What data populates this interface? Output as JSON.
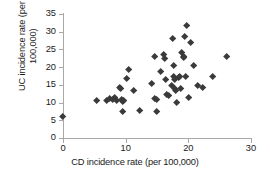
{
  "chart_data": {
    "type": "scatter",
    "title": "",
    "xlabel": "CD incidence rate (per 100,000)",
    "ylabel_line1": "UC incidence rate (per",
    "ylabel_line2": "100,000)",
    "ylabel": "UC incidence rate (per 100,000)",
    "xlim": [
      0,
      30
    ],
    "ylim": [
      0,
      35
    ],
    "xticks": [
      0,
      10,
      20,
      30
    ],
    "yticks": [
      0,
      5,
      10,
      15,
      20,
      25,
      30,
      35
    ],
    "xtick_labels": [
      "0",
      "10",
      "20",
      "30"
    ],
    "ytick_labels": [
      "0",
      "5",
      "10",
      "15",
      "20",
      "25",
      "30",
      "35"
    ],
    "grid": false,
    "legend": null,
    "marker": "diamond",
    "marker_color": "#3a3a3a",
    "axis_color": "#a8a8a8",
    "points": [
      [
        0.0,
        6.1
      ],
      [
        5.3,
        10.6
      ],
      [
        7.0,
        10.6
      ],
      [
        7.5,
        11.0
      ],
      [
        8.0,
        10.8
      ],
      [
        8.3,
        11.5
      ],
      [
        8.6,
        10.4
      ],
      [
        9.0,
        14.3
      ],
      [
        9.2,
        13.8
      ],
      [
        9.3,
        10.9
      ],
      [
        9.5,
        10.3
      ],
      [
        9.7,
        10.5
      ],
      [
        9.6,
        7.4
      ],
      [
        10.2,
        16.7
      ],
      [
        10.5,
        19.2
      ],
      [
        11.3,
        13.4
      ],
      [
        12.3,
        7.7
      ],
      [
        14.2,
        15.4
      ],
      [
        14.6,
        23.0
      ],
      [
        14.7,
        11.0
      ],
      [
        14.9,
        10.7
      ],
      [
        15.0,
        7.5
      ],
      [
        15.6,
        18.8
      ],
      [
        16.0,
        23.4
      ],
      [
        16.3,
        22.3
      ],
      [
        16.4,
        16.6
      ],
      [
        16.5,
        12.3
      ],
      [
        16.8,
        11.9
      ],
      [
        17.3,
        14.9
      ],
      [
        17.5,
        28.0
      ],
      [
        17.6,
        20.3
      ],
      [
        17.7,
        17.2
      ],
      [
        17.8,
        16.6
      ],
      [
        17.9,
        14.0
      ],
      [
        18.0,
        13.3
      ],
      [
        18.1,
        10.0
      ],
      [
        18.5,
        16.9
      ],
      [
        18.6,
        17.2
      ],
      [
        18.8,
        14.0
      ],
      [
        19.0,
        24.2
      ],
      [
        19.2,
        23.0
      ],
      [
        19.3,
        22.6
      ],
      [
        19.4,
        28.7
      ],
      [
        19.6,
        17.3
      ],
      [
        19.8,
        31.7
      ],
      [
        20.0,
        11.4
      ],
      [
        20.3,
        27.0
      ],
      [
        20.8,
        20.4
      ],
      [
        21.5,
        14.7
      ],
      [
        22.3,
        14.2
      ],
      [
        23.9,
        17.4
      ],
      [
        26.2,
        22.9
      ]
    ]
  }
}
